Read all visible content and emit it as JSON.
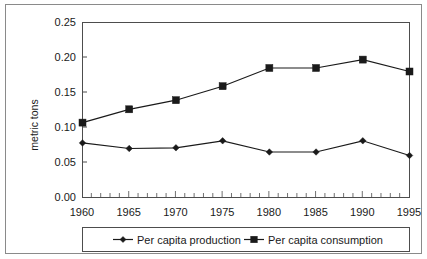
{
  "chart_data": {
    "type": "line",
    "title": "",
    "subtitle": "",
    "xlabel": "",
    "ylabel": "metric tons",
    "x": [
      1960,
      1965,
      1970,
      1975,
      1980,
      1985,
      1990,
      1995
    ],
    "categories": [
      "1960",
      "1965",
      "1970",
      "1975",
      "1980",
      "1985",
      "1990",
      "1995"
    ],
    "series": [
      {
        "name": "Per capita production",
        "marker": "diamond",
        "color": "#1a1a1a",
        "values": [
          0.078,
          0.07,
          0.071,
          0.081,
          0.065,
          0.065,
          0.081,
          0.06
        ]
      },
      {
        "name": "Per capita consumption",
        "marker": "square",
        "color": "#1a1a1a",
        "values": [
          0.107,
          0.126,
          0.139,
          0.159,
          0.185,
          0.185,
          0.197,
          0.18
        ]
      }
    ],
    "xlim": [
      1960,
      1995
    ],
    "ylim": [
      0.0,
      0.25
    ],
    "yticks": [
      0.0,
      0.05,
      0.1,
      0.15,
      0.2,
      0.25
    ],
    "ytick_labels": [
      "0.00",
      "0.05",
      "0.10",
      "0.15",
      "0.20",
      "0.25"
    ],
    "xticks": [
      1960,
      1965,
      1970,
      1975,
      1980,
      1985,
      1990,
      1995
    ],
    "xtick_labels": [
      "1960",
      "1965",
      "1970",
      "1975",
      "1980",
      "1985",
      "1990",
      "1995"
    ],
    "x_minor_tick_interval": 1,
    "grid": false,
    "legend_position": "bottom",
    "legend_entries": [
      "Per capita production",
      "Per capita consumption"
    ]
  },
  "axes": {
    "y_title": "metric tons",
    "y_tick_labels": [
      "0.25",
      "0.20",
      "0.15",
      "0.10",
      "0.05",
      "0.00"
    ],
    "x_tick_labels": [
      "1960",
      "1965",
      "1970",
      "1975",
      "1980",
      "1985",
      "1990",
      "1995"
    ]
  },
  "legend": {
    "items": [
      {
        "label": "Per capita production",
        "marker": "diamond-marker"
      },
      {
        "label": "Per capita consumption",
        "marker": "square-marker"
      }
    ]
  }
}
